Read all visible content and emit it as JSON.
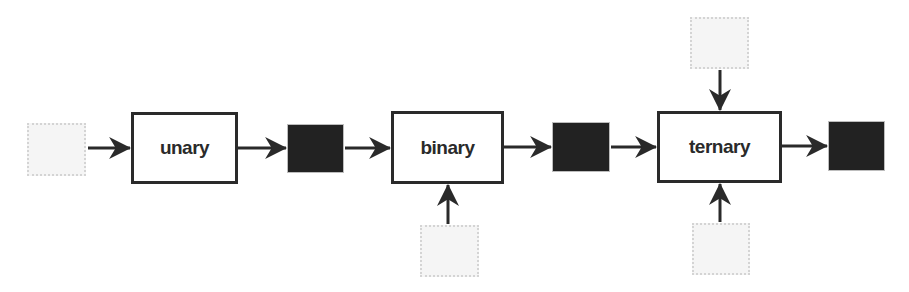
{
  "diagram": {
    "type": "dataflow",
    "operators": [
      {
        "id": "unary",
        "label": "unary",
        "inputs": 1,
        "outputs": 1
      },
      {
        "id": "binary",
        "label": "binary",
        "inputs": 2,
        "outputs": 1
      },
      {
        "id": "ternary",
        "label": "ternary",
        "inputs": 3,
        "outputs": 1
      }
    ],
    "colors": {
      "input_fill": "#f5f5f5",
      "input_border": "#d4d4d4",
      "output_fill": "#222222",
      "stroke": "#2a2a2a"
    },
    "edges": [
      {
        "from": "input-1",
        "to": "unary"
      },
      {
        "from": "unary",
        "to": "output-1"
      },
      {
        "from": "output-1",
        "to": "binary"
      },
      {
        "from": "input-2",
        "to": "binary"
      },
      {
        "from": "binary",
        "to": "output-2"
      },
      {
        "from": "output-2",
        "to": "ternary"
      },
      {
        "from": "input-3-top",
        "to": "ternary"
      },
      {
        "from": "input-3-bottom",
        "to": "ternary"
      },
      {
        "from": "ternary",
        "to": "output-3"
      }
    ]
  }
}
